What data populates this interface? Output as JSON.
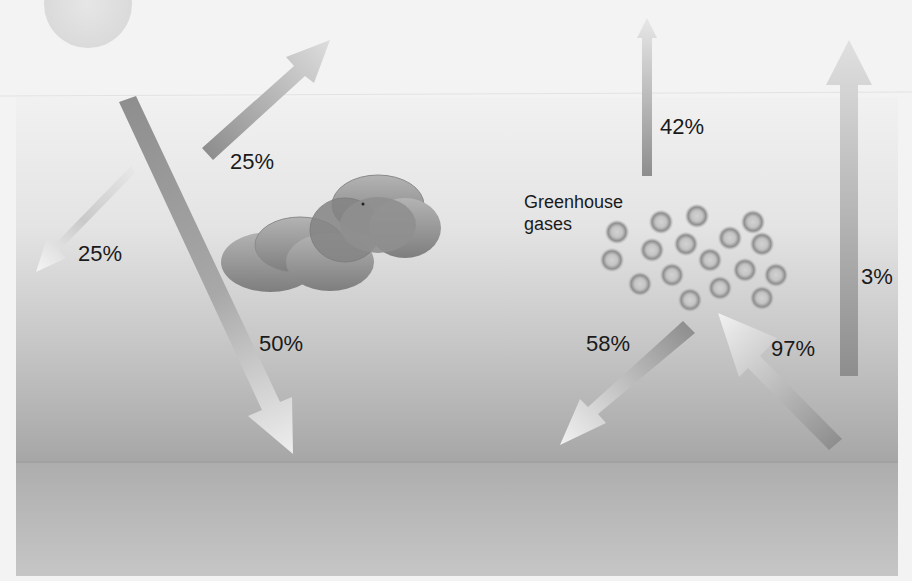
{
  "diagram": {
    "title": "",
    "colors": {
      "background": "#f3f3f3",
      "sky_top": "#f2f2f2",
      "sky_bottom": "#a9a9a9",
      "ground": "#b8b8b8",
      "arrow_dark": "#8a8a8a",
      "arrow_light": "#e8e8e8",
      "cloud": "#8c8c8c",
      "text": "#1a1a1a"
    },
    "elements": {
      "sun": {
        "label": ""
      },
      "cloud": {
        "label": ""
      },
      "greenhouse_gases": {
        "label_line1": "Greenhouse",
        "label_line2": "gases"
      }
    },
    "flows": [
      {
        "id": "reflected-by-atmosphere",
        "label": "25%",
        "direction": "up-right"
      },
      {
        "id": "reflected-left",
        "label": "25%",
        "direction": "down-left"
      },
      {
        "id": "absorbed-by-surface",
        "label": "50%",
        "direction": "down-right"
      },
      {
        "id": "escaping-to-space-from-gases",
        "label": "42%",
        "direction": "up"
      },
      {
        "id": "back-radiation-to-surface",
        "label": "58%",
        "direction": "down-left"
      },
      {
        "id": "surface-emission-absorbed",
        "label": "97%",
        "direction": "up-left"
      },
      {
        "id": "surface-emission-escaping",
        "label": "3%",
        "direction": "up"
      }
    ]
  }
}
